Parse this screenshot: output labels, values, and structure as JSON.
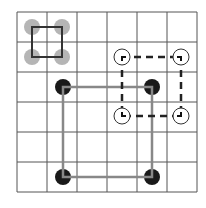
{
  "grid": {
    "cols": 6,
    "rows": 6,
    "origin_x": 17,
    "origin_y": 12,
    "cell": 30,
    "line_color": "#555555"
  },
  "shapes": {
    "small_square": {
      "style": "solid",
      "color": "#333333",
      "markers": "gray-dot",
      "marker_color": "#b5b5b5",
      "points": [
        [
          32,
          27
        ],
        [
          62,
          27
        ],
        [
          62,
          57
        ],
        [
          32,
          57
        ]
      ]
    },
    "large_square": {
      "style": "solid",
      "color": "#888888",
      "markers": "black-dot",
      "marker_color": "#1a1a1a",
      "points": [
        [
          63,
          87
        ],
        [
          152,
          87
        ],
        [
          152,
          177
        ],
        [
          63,
          177
        ]
      ]
    },
    "dashed_square": {
      "style": "dashed",
      "color": "#222222",
      "markers": "open-circle-corner",
      "marker_color": "#333333",
      "points": [
        [
          122,
          57
        ],
        [
          181,
          57
        ],
        [
          181,
          116
        ],
        [
          122,
          116
        ]
      ]
    }
  }
}
